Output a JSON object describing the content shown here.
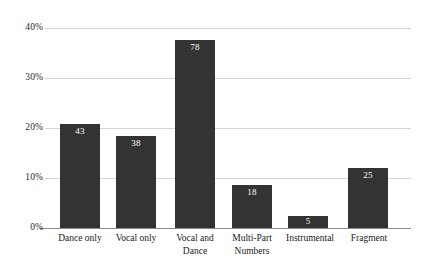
{
  "chart_data": {
    "type": "bar",
    "title": "",
    "subtitle": "",
    "xlabel": "",
    "ylabel": "",
    "categories": [
      "Dance only",
      "Vocal only",
      "Vocal and Dance",
      "Multi-Part Numbers",
      "Instrumental",
      "Fragment"
    ],
    "counts": [
      43,
      38,
      78,
      18,
      5,
      25
    ],
    "values": [
      20.8,
      18.4,
      37.7,
      8.7,
      2.4,
      12.1
    ],
    "value_unit": "percent",
    "data_labels": [
      "43",
      "38",
      "78",
      "18",
      "5",
      "25"
    ],
    "ylim": [
      0,
      40
    ],
    "ytick_values": [
      0,
      10,
      20,
      30,
      40
    ],
    "ytick_labels": [
      "0%",
      "10%",
      "20%",
      "30%",
      "40%"
    ],
    "grid": true,
    "grid_axis": "y",
    "legend": false,
    "legend_position": "none",
    "bar_color": "#333333",
    "grid_color": "#d4d4d4",
    "axis_color": "#8a8a8a",
    "data_label_color": "#ffffff",
    "background_color": "#ffffff",
    "total_count": 207
  }
}
